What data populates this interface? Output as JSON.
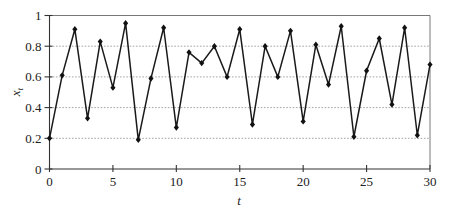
{
  "chart_data": {
    "type": "line",
    "title": "",
    "xlabel": "t",
    "ylabel": "x_t",
    "xlim": [
      0,
      30
    ],
    "ylim": [
      0,
      1
    ],
    "x_ticks": [
      0,
      5,
      10,
      15,
      20,
      25,
      30
    ],
    "x_tick_labels": [
      "0",
      "5",
      "10",
      "15",
      "20",
      "25",
      "30"
    ],
    "y_ticks": [
      0,
      0.2,
      0.4,
      0.6,
      0.8,
      1
    ],
    "y_tick_labels": [
      "0",
      "0.2",
      "0.4",
      "0.6",
      "0.8",
      "1"
    ],
    "grid": "horizontal dotted at 0.2, 0.4, 0.6, 0.8",
    "legend": "none",
    "marker": "diamond",
    "series": [
      {
        "name": "x_t",
        "x": [
          0,
          1,
          2,
          3,
          4,
          5,
          6,
          7,
          8,
          9,
          10,
          11,
          12,
          13,
          14,
          15,
          16,
          17,
          18,
          19,
          20,
          21,
          22,
          23,
          24,
          25,
          26,
          27,
          28,
          29,
          30
        ],
        "values": [
          0.2,
          0.61,
          0.91,
          0.33,
          0.83,
          0.53,
          0.95,
          0.19,
          0.59,
          0.92,
          0.27,
          0.76,
          0.69,
          0.8,
          0.6,
          0.91,
          0.29,
          0.8,
          0.6,
          0.9,
          0.31,
          0.81,
          0.55,
          0.93,
          0.21,
          0.64,
          0.85,
          0.42,
          0.92,
          0.22,
          0.68
        ]
      }
    ]
  },
  "axes": {
    "x_label_main": "t",
    "y_label_main": "x",
    "y_label_sub": "t"
  },
  "colors": {
    "line": "#1a1a1a",
    "grid": "#9a9a9a",
    "axis": "#333333"
  }
}
